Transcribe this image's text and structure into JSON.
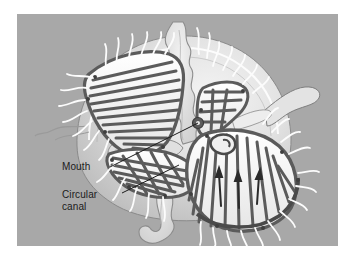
{
  "figure": {
    "kind": "biological-illustration",
    "panel": {
      "background_color": "#a8a8a8",
      "page_background_color": "#ffffff",
      "x": 17,
      "y": 14,
      "width": 321,
      "height": 232
    }
  },
  "labels": [
    {
      "id": "mouth",
      "text": "Mouth",
      "text_color": "#1b1b1b",
      "x": 45,
      "y": 147,
      "leader": {
        "from_x": 93,
        "from_y": 153,
        "to_x": 181,
        "to_y": 109
      }
    },
    {
      "id": "circular-canal",
      "text": "Circular\ncanal",
      "line1": "Circular",
      "line2": "canal",
      "text_color": "#1b1b1b",
      "x": 45,
      "y": 175,
      "leader": {
        "from_x": 105,
        "from_y": 179,
        "to_x": 162,
        "to_y": 151
      }
    }
  ],
  "anatomy": {
    "bell_color": "#d6d6d6",
    "bell_highlight_color": "#f0f0f0",
    "radial_canal_color": "#5b5b5b",
    "oral_arm_color": "#e8e8e8",
    "oral_arm_shade_color": "#bdbdbd",
    "tentacle_color": "#fbfbfb",
    "outline_color": "#6e6e6e",
    "flow_arrow_color": "#2b2b2b",
    "parts": [
      "bell (umbrella)",
      "radial canals",
      "circular canal",
      "mouth",
      "oral arms",
      "marginal tentacles",
      "gastrovascular flow arrows"
    ]
  },
  "lobes": [
    {
      "id": "upper-left-lobe",
      "radial_canal_count": 14,
      "has_flow_arrows": false
    },
    {
      "id": "upper-right-lobe",
      "radial_canal_count": 6,
      "has_flow_arrows": false
    },
    {
      "id": "lower-left-lobe",
      "radial_canal_count": 12,
      "has_flow_arrows": false
    },
    {
      "id": "lower-right-lobe",
      "radial_canal_count": 16,
      "has_flow_arrows": true
    }
  ]
}
